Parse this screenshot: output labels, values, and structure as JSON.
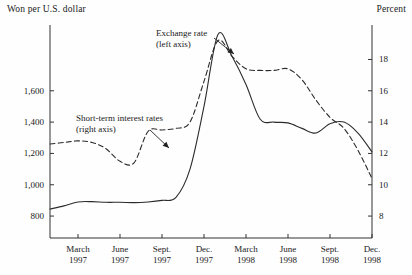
{
  "chart_data": {
    "type": "line",
    "title": "",
    "subtitle": "",
    "left_axis_label": "Won per U.S. dollar",
    "right_axis_label": "Percent",
    "xlabel": "",
    "grid": false,
    "legend_position": "inline-annotations",
    "x_tick_labels": [
      {
        "month": "March",
        "year": "1997"
      },
      {
        "month": "June",
        "year": "1997"
      },
      {
        "month": "Sept.",
        "year": "1997"
      },
      {
        "month": "Dec.",
        "year": "1997"
      },
      {
        "month": "March",
        "year": "1998"
      },
      {
        "month": "June",
        "year": "1998"
      },
      {
        "month": "Sept.",
        "year": "1998"
      },
      {
        "month": "Dec.",
        "year": "1998"
      }
    ],
    "left_ticks": [
      "1,600",
      "1,400",
      "1,200",
      "1,000",
      "800"
    ],
    "left_tick_values": [
      1600,
      1400,
      1200,
      1000,
      800
    ],
    "right_ticks": [
      "18",
      "16",
      "14",
      "12",
      "10",
      "8"
    ],
    "right_tick_values": [
      18,
      16,
      14,
      12,
      10,
      8
    ],
    "ylim_left": [
      660,
      2020
    ],
    "ylim_right": [
      6.6,
      20.2
    ],
    "xlim": [
      "1997-01",
      "1998-12"
    ],
    "annotations": [
      {
        "name": "exchange-rate",
        "line1": "Exchange rate",
        "line2": "(left axis)"
      },
      {
        "name": "short-term-interest-rates",
        "line1": "Short-term interest rates",
        "line2": "(right axis)"
      }
    ],
    "series": [
      {
        "name": "Exchange rate",
        "axis": "left",
        "style": "solid",
        "unit": "Won per U.S. dollar",
        "x": [
          "1997-01",
          "1997-02",
          "1997-03",
          "1997-04",
          "1997-05",
          "1997-06",
          "1997-07",
          "1997-08",
          "1997-09",
          "1997-10",
          "1997-11",
          "1997-12",
          "1998-01",
          "1998-02",
          "1998-03",
          "1998-04",
          "1998-05",
          "1998-06",
          "1998-07",
          "1998-08",
          "1998-09",
          "1998-10",
          "1998-11",
          "1998-12"
        ],
        "values": [
          845,
          865,
          890,
          892,
          888,
          888,
          886,
          890,
          900,
          920,
          1100,
          1500,
          1960,
          1820,
          1640,
          1420,
          1400,
          1395,
          1360,
          1330,
          1390,
          1400,
          1330,
          1210
        ]
      },
      {
        "name": "Short-term interest rates",
        "axis": "right",
        "style": "dashed",
        "unit": "Percent",
        "x": [
          "1997-01",
          "1997-02",
          "1997-03",
          "1997-04",
          "1997-05",
          "1997-06",
          "1997-07",
          "1997-08",
          "1997-09",
          "1997-10",
          "1997-11",
          "1997-12",
          "1998-01",
          "1998-02",
          "1998-03",
          "1998-04",
          "1998-05",
          "1998-06",
          "1998-07",
          "1998-08",
          "1998-09",
          "1998-10",
          "1998-11",
          "1998-12"
        ],
        "values": [
          12.6,
          12.7,
          12.8,
          12.7,
          12.3,
          11.5,
          11.4,
          13.4,
          13.5,
          13.6,
          14.0,
          16.6,
          19.2,
          18.2,
          17.4,
          17.3,
          17.3,
          17.4,
          16.7,
          15.4,
          14.3,
          13.6,
          12.2,
          10.4
        ]
      }
    ]
  }
}
